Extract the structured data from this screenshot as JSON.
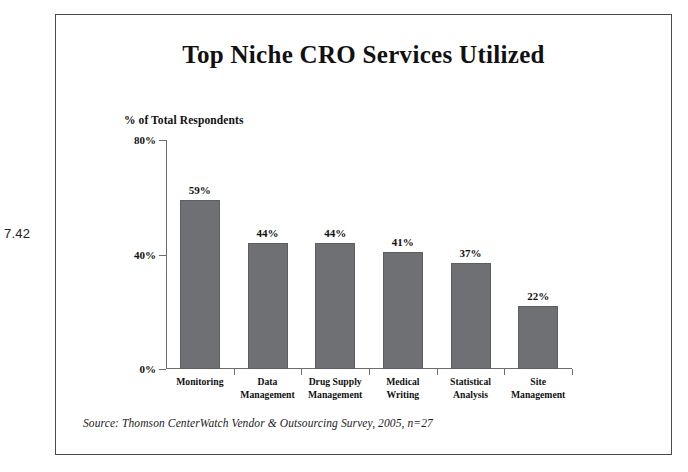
{
  "figure_number": "7.42",
  "chart_data": {
    "type": "bar",
    "title": "Top Niche CRO Services Utilized",
    "xlabel": "",
    "ylabel": "% of Total Respondents",
    "ylim": [
      0,
      80
    ],
    "grid": false,
    "legend": "none",
    "y_ticks": [
      "0%",
      "40%",
      "80%"
    ],
    "y_tick_values": [
      0,
      40,
      80
    ],
    "categories": [
      "Monitoring",
      "Data Management",
      "Drug Supply Management",
      "Medical Writing",
      "Statistical Analysis",
      "Site Management"
    ],
    "category_lines": [
      [
        "Monitoring"
      ],
      [
        "Data",
        "Management"
      ],
      [
        "Drug Supply",
        "Management"
      ],
      [
        "Medical",
        "Writing"
      ],
      [
        "Statistical",
        "Analysis"
      ],
      [
        "Site",
        "Management"
      ]
    ],
    "values": [
      59,
      44,
      44,
      41,
      37,
      22
    ],
    "value_labels": [
      "59%",
      "44%",
      "44%",
      "41%",
      "37%",
      "22%"
    ],
    "bar_color": "#6e7073",
    "bar_border_color": "#5c5e61",
    "axis_color": "#6d6d6d",
    "background": "#ffffff"
  },
  "source_note": "Source: Thomson CenterWatch Vendor & Outsourcing Survey, 2005, n=27"
}
